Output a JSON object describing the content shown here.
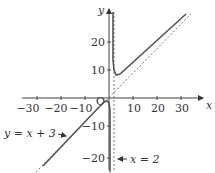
{
  "axes": {
    "x_label": "x",
    "y_label": "y",
    "origin_label": "O",
    "x_ticks": [
      {
        "value": -30,
        "label": "−30"
      },
      {
        "value": -20,
        "label": "−20"
      },
      {
        "value": -10,
        "label": "−10"
      },
      {
        "value": 10,
        "label": "10"
      },
      {
        "value": 20,
        "label": "20"
      },
      {
        "value": 30,
        "label": "30"
      }
    ],
    "y_ticks": [
      {
        "value": 20,
        "label": "20"
      },
      {
        "value": 10,
        "label": "10"
      },
      {
        "value": -10,
        "label": "−10"
      },
      {
        "value": -20,
        "label": "−20"
      }
    ]
  },
  "annotations": {
    "oblique_asymptote": "y = x + 3",
    "vertical_asymptote": "x = 2"
  },
  "colors": {
    "curve": "#555555",
    "axes": "#444444",
    "asymptote": "#777777"
  }
}
